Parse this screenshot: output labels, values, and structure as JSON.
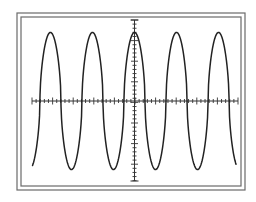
{
  "chart_data": {
    "type": "line",
    "title": "",
    "xlabel": "",
    "ylabel": "",
    "grid": false,
    "legend": null,
    "axes": {
      "x_divisions": 10,
      "y_divisions": 8,
      "minor_ticks_per_division": 5,
      "xlim": [
        -5,
        5
      ],
      "ylim": [
        -4,
        4
      ]
    },
    "series": [
      {
        "name": "waveform",
        "shape": "periodic (sine-like, rounded peaks)",
        "cycles_visible": 5,
        "period_divisions": 2.04,
        "amplitude_divisions": 3.33,
        "offset_divisions": 0,
        "peaks_x_divisions": [
          -4.08,
          -2.04,
          0.0,
          2.04,
          4.08
        ],
        "troughs_x_divisions": [
          -3.06,
          -1.02,
          1.02,
          3.06
        ],
        "start": {
          "x": -4.95,
          "y": -3.35
        },
        "end": {
          "x": 4.95,
          "y": -3.25
        }
      }
    ]
  },
  "colors": {
    "background": "#ffffff",
    "frame": "#6a6a6a",
    "trace": "#222222",
    "axes": "#333333"
  },
  "layout": {
    "frame_outer": {
      "x": 17,
      "y": 13,
      "w": 228,
      "h": 177
    },
    "frame_inner": {
      "x": 21,
      "y": 17,
      "w": 220,
      "h": 169
    },
    "origin": {
      "x": 134.5,
      "y": 101
    },
    "div_px": 20.6,
    "x_axis": {
      "x1": 32,
      "x2": 238
    },
    "y_axis": {
      "y1": 20,
      "y2": 181
    }
  }
}
